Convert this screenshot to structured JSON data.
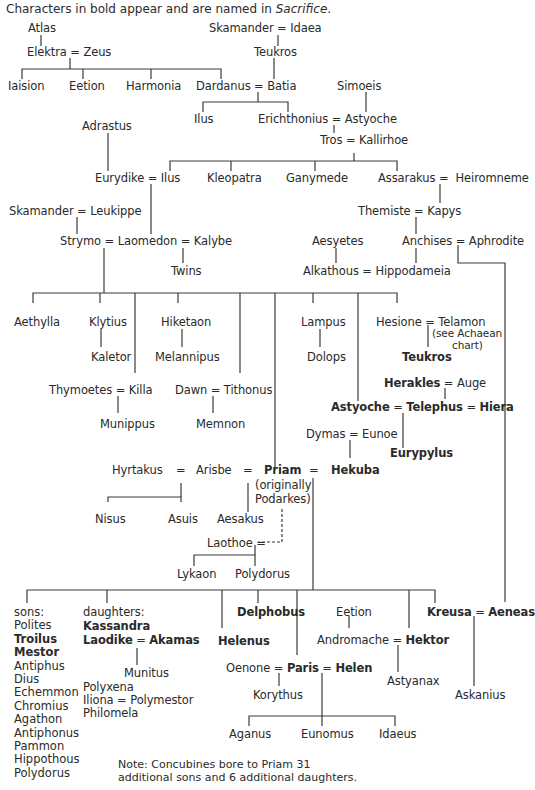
{
  "header": {
    "caption_prefix": "Characters in bold appear and are named in ",
    "caption_work": "Sacrifice",
    "caption_suffix": "."
  },
  "nodes": {
    "atlas": "Atlas",
    "elektra_zeus": "Elektra = Zeus",
    "iaision": "Iaision",
    "eetion1": "Eetion",
    "harmonia": "Harmonia",
    "dardanus_batia": "Dardanus = Batia",
    "skamander_idaea": "Skamander = Idaea",
    "teukros1": "Teukros",
    "simoeis": "Simoeis",
    "ilus1": "Ilus",
    "erichthonius_astyoche": "Erichthonius = Astyoche",
    "tros_kallirhoe": "Tros = Kallirhoe",
    "adrastus": "Adrastus",
    "eurydike_ilus": "Eurydike = Ilus",
    "kleopatra": "Kleopatra",
    "ganymede": "Ganymede",
    "assarakus_heiromneme": "Assarakus =  Heiromneme",
    "skamander_leukippe": "Skamander = Leukippe",
    "themiste_kapys": "Themiste = Kapys",
    "strymo_laomedon_kalybe": "Strymo = Laomedon = Kalybe",
    "aesyetes": "Aesyetes",
    "anchises_aphrodite": "Anchises = Aphrodite",
    "twins": "Twins",
    "alkathous_hippodameia": "Alkathous = Hippodameia",
    "aethylla": "Aethylla",
    "klytius": "Klytius",
    "hiketaon": "Hiketaon",
    "lampus": "Lampus",
    "hesione_telamon": "Hesione = Telamon",
    "see_achaean_1": "(see Achaean",
    "see_achaean_2": "chart)",
    "kaletor": "Kaletor",
    "melannipus": "Melannipus",
    "dolops": "Dolops",
    "teukros2": "Teukros",
    "thymoetes_killa": "Thymoetes = Killa",
    "dawn_tithonus": "Dawn = Tithonus",
    "herakles": "Herakles",
    "auge": " = Auge",
    "astyoche2": "Astyoche",
    "telephus": "Telephus",
    "hiera": "Hiera",
    "eq": " = ",
    "munippus": "Munippus",
    "memnon": "Memnon",
    "dymas_eunoe": "Dymas = Eunoe",
    "eurypylus": "Eurypylus",
    "hyrtakus": "Hyrtakus",
    "arisbe": "Arisbe",
    "priam": "Priam",
    "hekuba": "Hekuba",
    "eq_sign": "=",
    "priam_note_1": "(originally",
    "priam_note_2": "Podarkes)",
    "nisus": "Nisus",
    "asuis": "Asuis",
    "aesakus": "Aesakus",
    "laothoe": "Laothoe =",
    "lykaon": "Lykaon",
    "polydorus1": "Polydorus",
    "delphobus": "Delphobus",
    "eetion2": "Eetion",
    "kreusa": "Kreusa",
    "aeneas": "Aeneas",
    "helenus": "Helenus",
    "andromache": "Andromache",
    "hektor": "Hektor",
    "oenone": "Oenone",
    "paris": "Paris",
    "helen": "Helen",
    "astyanax": "Astyanax",
    "askanius": "Askanius",
    "korythus": "Korythus",
    "aganus": "Aganus",
    "eunomus": "Eunomus",
    "idaeus": "Idaeus",
    "munitus": "Munitus"
  },
  "sons": {
    "heading": "sons:",
    "items": [
      {
        "name": "Polites",
        "bold": false
      },
      {
        "name": "Troilus",
        "bold": true
      },
      {
        "name": "Mestor",
        "bold": true
      },
      {
        "name": "Antiphus",
        "bold": false
      },
      {
        "name": "Dius",
        "bold": false
      },
      {
        "name": "Echemmon",
        "bold": false
      },
      {
        "name": "Chromius",
        "bold": false
      },
      {
        "name": "Agathon",
        "bold": false
      },
      {
        "name": "Antiphonus",
        "bold": false
      },
      {
        "name": "Pammon",
        "bold": false
      },
      {
        "name": "Hippothous",
        "bold": false
      },
      {
        "name": "Polydorus",
        "bold": false
      }
    ]
  },
  "daughters": {
    "heading": "daughters:",
    "kassandra": "Kassandra",
    "laodike": "Laodike",
    "akamas": "Akamas",
    "polyxena": "Polyxena",
    "iliona_polymestor": "Iliona = Polymestor",
    "philomela": "Philomela"
  },
  "note": {
    "line1": "Note: Concubines bore to Priam 31",
    "line2": "additional sons and 6 additional daughters."
  }
}
